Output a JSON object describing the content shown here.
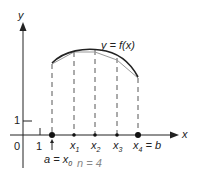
{
  "diagram": {
    "axis_labels": {
      "x": "x",
      "y": "y"
    },
    "curve_label": "y = f(x)",
    "tick_labels": {
      "origin": "0",
      "x_one": "1",
      "y_one": "1"
    },
    "points": [
      {
        "name": "x",
        "sub": "1"
      },
      {
        "name": "x",
        "sub": "2"
      },
      {
        "name": "x",
        "sub": "3"
      },
      {
        "name": "x",
        "sub": "4",
        "suffix": " = b"
      }
    ],
    "start_label": {
      "text": "a = x",
      "sub": "0"
    },
    "n_label": "n = 4",
    "colors": {
      "line": "#222222",
      "dash": "#444444",
      "chord": "#999999"
    }
  }
}
